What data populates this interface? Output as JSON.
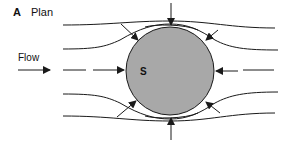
{
  "figure": {
    "panel_letter": "A",
    "panel_title": "Plan",
    "flow_label": "Flow",
    "body_label": "S",
    "colors": {
      "body_fill": "#a8a8a8",
      "line": "#1a1a1a",
      "background": "#ffffff"
    },
    "body": {
      "shape": "circle",
      "cx": 170,
      "cy": 71,
      "r": 44
    },
    "streamlines": 5,
    "pressure_arrows": 8
  }
}
